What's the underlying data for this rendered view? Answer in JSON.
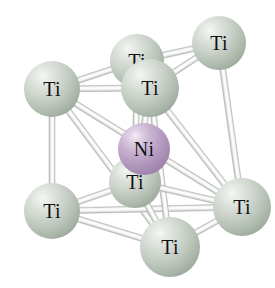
{
  "figure": {
    "kind": "ball-and-stick-crystal-structure",
    "background_color": "#ffffff",
    "width": 275,
    "height": 288
  },
  "elements": {
    "ti": {
      "symbol": "Ti",
      "name": "titanium",
      "color": "#c3ccc2",
      "highlight_color": "#f4f7f4",
      "shadow_color": "#8a978a"
    },
    "ni": {
      "symbol": "Ni",
      "name": "nickel",
      "color": "#b89fc2",
      "highlight_color": "#f3eef5",
      "shadow_color": "#8f739b"
    }
  },
  "bond": {
    "color": "#f2f2f2",
    "edge_color": "#b9bdb9",
    "highlight_color": "#ffffff"
  },
  "atoms": [
    {
      "id": "ti-top-right",
      "label": "Ti",
      "element": "ti",
      "cx": 219,
      "cy": 43,
      "r": 27,
      "font_size": 20,
      "z": 3
    },
    {
      "id": "ti-top-back",
      "label": "Ti",
      "element": "ti",
      "cx": 137,
      "cy": 61,
      "r": 27,
      "font_size": 20,
      "z": 4
    },
    {
      "id": "ti-upper-left",
      "label": "Ti",
      "element": "ti",
      "cx": 52,
      "cy": 89,
      "r": 28,
      "font_size": 20,
      "z": 5
    },
    {
      "id": "ti-top-front",
      "label": "Ti",
      "element": "ti",
      "cx": 150,
      "cy": 88,
      "r": 29,
      "font_size": 20,
      "z": 8
    },
    {
      "id": "ni-center",
      "label": "Ni",
      "element": "ni",
      "cx": 144,
      "cy": 149,
      "r": 26,
      "font_size": 20,
      "z": 9
    },
    {
      "id": "ti-inner-lower",
      "label": "Ti",
      "element": "ti",
      "cx": 135,
      "cy": 182,
      "r": 26,
      "font_size": 20,
      "z": 7
    },
    {
      "id": "ti-lower-left",
      "label": "Ti",
      "element": "ti",
      "cx": 52,
      "cy": 211,
      "r": 28,
      "font_size": 20,
      "z": 6
    },
    {
      "id": "ti-right",
      "label": "Ti",
      "element": "ti",
      "cx": 242,
      "cy": 207,
      "r": 29,
      "font_size": 20,
      "z": 10
    },
    {
      "id": "ti-bottom",
      "label": "Ti",
      "element": "ti",
      "cx": 170,
      "cy": 247,
      "r": 30,
      "font_size": 20,
      "z": 11
    }
  ],
  "bonds": [
    {
      "id": "b1",
      "from": "ti-upper-left",
      "to": "ti-top-back",
      "width": 6
    },
    {
      "id": "b2",
      "from": "ti-upper-left",
      "to": "ti-top-front",
      "width": 6
    },
    {
      "id": "b3",
      "from": "ti-top-back",
      "to": "ti-top-right",
      "width": 6
    },
    {
      "id": "b4",
      "from": "ti-top-front",
      "to": "ti-top-right",
      "width": 6
    },
    {
      "id": "b5",
      "from": "ti-upper-left",
      "to": "ti-lower-left",
      "width": 6
    },
    {
      "id": "b6",
      "from": "ti-top-right",
      "to": "ti-right",
      "width": 6
    },
    {
      "id": "b7",
      "from": "ti-upper-left",
      "to": "ti-right",
      "width": 6
    },
    {
      "id": "b8",
      "from": "ti-upper-left",
      "to": "ti-bottom",
      "width": 6
    },
    {
      "id": "b9",
      "from": "ti-lower-left",
      "to": "ti-bottom",
      "width": 6
    },
    {
      "id": "b10",
      "from": "ti-lower-left",
      "to": "ti-right",
      "width": 6
    },
    {
      "id": "b11",
      "from": "ti-bottom",
      "to": "ti-right",
      "width": 6
    },
    {
      "id": "b12",
      "from": "ti-top-front",
      "to": "ti-bottom",
      "width": 6
    },
    {
      "id": "b13",
      "from": "ti-top-front",
      "to": "ti-right",
      "width": 6
    },
    {
      "id": "b14",
      "from": "ti-top-front",
      "to": "ti-inner-lower",
      "width": 6
    },
    {
      "id": "b15",
      "from": "ti-inner-lower",
      "to": "ti-right",
      "width": 6
    },
    {
      "id": "b16",
      "from": "ti-top-back",
      "to": "ti-inner-lower",
      "width": 6
    },
    {
      "id": "b17",
      "from": "ti-lower-left",
      "to": "ti-inner-lower",
      "width": 6
    },
    {
      "id": "b18",
      "from": "ti-inner-lower",
      "to": "ti-bottom",
      "width": 6
    }
  ]
}
